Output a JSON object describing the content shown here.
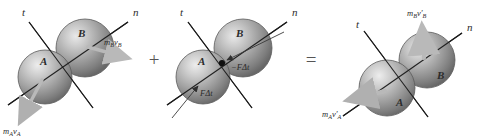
{
  "figure": {
    "background_color": "#ffffff",
    "width": 483,
    "height": 140,
    "equation_reading": "m_A v_A + m_B v_B  +  (F dt impulse pair)  =  m_A v'_A + m_B v'_B"
  },
  "operators": [
    {
      "symbol": "+",
      "name": "plus-operator",
      "x": 154,
      "y": 62
    },
    {
      "symbol": "=",
      "name": "equals-operator",
      "x": 311,
      "y": 62
    }
  ],
  "colors": {
    "sphere_light": "#e8e8e8",
    "sphere_mid": "#9a9a9a",
    "sphere_dark": "#6a6a6a",
    "sphere_edge": "#4f4f4f",
    "axis_line": "#1a1a1a",
    "momentum_arrow": "#b8b8b8",
    "impulse_arrow": "#3a3a3a",
    "contact_dot": "#111111",
    "text": "#2b2b2b"
  },
  "panels": [
    {
      "id": "panel-initial",
      "name": "initial-momentum-panel",
      "caption": "Momenta of spheres just before impact",
      "axes": [
        {
          "label": "t",
          "name": "axis-label-t",
          "x": 22,
          "y": 16
        },
        {
          "label": "n",
          "name": "axis-label-n",
          "x": 133,
          "y": 16
        }
      ],
      "spheres": [
        {
          "label": "A",
          "name": "sphere-a",
          "cx": 45,
          "cy": 77,
          "r": 27
        },
        {
          "label": "B",
          "name": "sphere-b",
          "cx": 85,
          "cy": 48,
          "r": 29
        }
      ],
      "vectors": [
        {
          "label": "m",
          "sub": "B",
          "var": "v",
          "varsub": "B",
          "prime": "",
          "name": "momentum-vector-b",
          "full_text": "mBvB"
        },
        {
          "label": "m",
          "sub": "A",
          "var": "v",
          "varsub": "A",
          "prime": "",
          "name": "momentum-vector-a",
          "full_text": "mAvA"
        }
      ]
    },
    {
      "id": "panel-impulse",
      "name": "impulse-panel",
      "caption": "Equal and opposite impulses during contact",
      "axes": [
        {
          "label": "t",
          "name": "axis-label-t",
          "x": 180,
          "y": 16
        },
        {
          "label": "n",
          "name": "axis-label-n",
          "x": 292,
          "y": 16
        }
      ],
      "spheres": [
        {
          "label": "A",
          "name": "sphere-a",
          "cx": 203,
          "cy": 77,
          "r": 27
        },
        {
          "label": "B",
          "name": "sphere-b",
          "cx": 243,
          "cy": 48,
          "r": 29
        }
      ],
      "impulses": [
        {
          "sign": "−",
          "force": "F",
          "delta": "Δ",
          "time": "t",
          "name": "impulse-on-b",
          "full_text": "-FΔt"
        },
        {
          "sign": "",
          "force": "F",
          "delta": "Δ",
          "time": "t",
          "name": "impulse-on-a",
          "full_text": "FΔt"
        }
      ],
      "contact_point": {
        "name": "contact-point-dot",
        "cx": 222,
        "cy": 63
      }
    },
    {
      "id": "panel-final",
      "name": "final-momentum-panel",
      "caption": "Momenta of spheres just after impact",
      "axes": [
        {
          "label": "t",
          "name": "axis-label-t",
          "x": 356,
          "y": 25
        },
        {
          "label": "n",
          "name": "axis-label-n",
          "x": 466,
          "y": 28
        }
      ],
      "spheres": [
        {
          "label": "A",
          "name": "sphere-a",
          "cx": 387,
          "cy": 88,
          "r": 28
        },
        {
          "label": "B",
          "name": "sphere-b",
          "cx": 427,
          "cy": 60,
          "r": 28
        }
      ],
      "vectors": [
        {
          "label": "m",
          "sub": "B",
          "var": "v",
          "varsub": "B",
          "prime": "′",
          "name": "final-momentum-vector-b",
          "full_text": "mBv′B"
        },
        {
          "label": "m",
          "sub": "A",
          "var": "v",
          "varsub": "A",
          "prime": "′",
          "name": "final-momentum-vector-a",
          "full_text": "mAv′A"
        }
      ]
    }
  ]
}
